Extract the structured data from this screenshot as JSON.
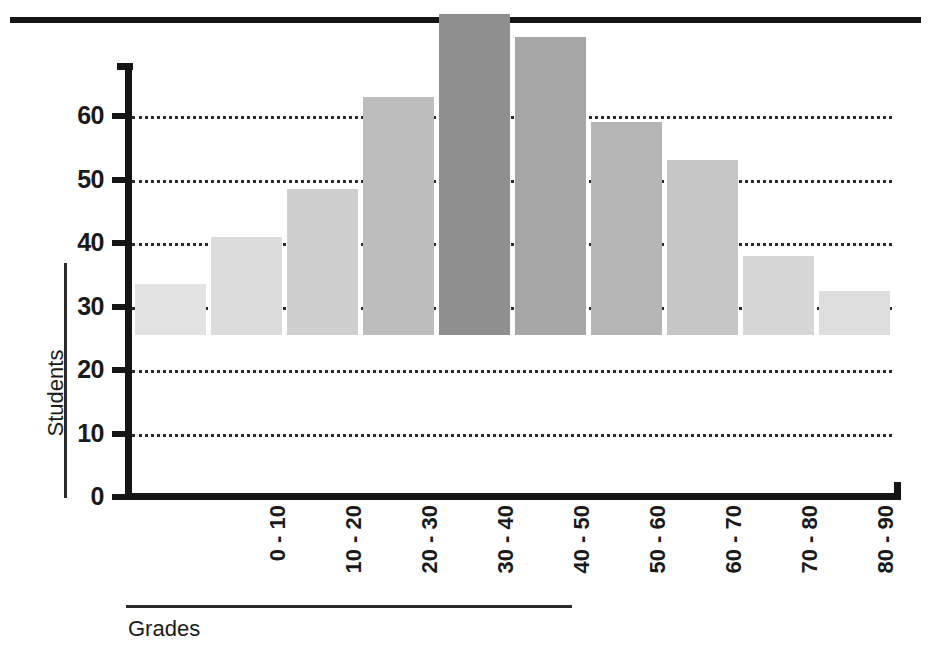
{
  "chart_data": {
    "type": "bar",
    "title": "",
    "xlabel": "Grades",
    "ylabel": "Students",
    "categories": [
      "0 - 10",
      "10 - 20",
      "20 - 30",
      "30 - 40",
      "40 - 50",
      "50 - 60",
      "60 - 70",
      "70 - 80",
      "80 - 90",
      "90 -100"
    ],
    "values": [
      8,
      15.5,
      23,
      37.5,
      50.5,
      47,
      33.5,
      27.5,
      12.5,
      7
    ],
    "bar_colors": [
      "#e3e3e3",
      "#dcdcdc",
      "#cfcfcf",
      "#bdbdbd",
      "#8f8f8f",
      "#a6a6a6",
      "#b5b5b5",
      "#c6c6c6",
      "#d6d6d6",
      "#dedede"
    ],
    "ylim": [
      0,
      68
    ],
    "yticks": [
      0,
      10,
      20,
      30,
      40,
      50,
      60
    ],
    "ytick_labels": [
      "0",
      "10",
      "20",
      "30",
      "40",
      "50",
      "60"
    ],
    "gridlines": [
      10,
      20,
      30,
      40,
      50,
      60
    ],
    "grid": true,
    "legend": "none",
    "axis_color": "#151515",
    "grid_color": "#2b2b2b",
    "text_color": "#1a1a1a"
  }
}
